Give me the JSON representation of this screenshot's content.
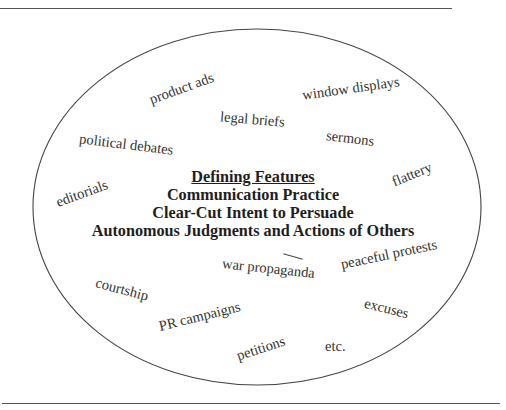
{
  "diagram": {
    "center": {
      "title": "Defining Features",
      "features": [
        "Communication Practice",
        "Clear-Cut Intent to Persuade",
        "Autonomous Judgments and Actions of Others"
      ]
    },
    "examples": [
      {
        "label": "product ads"
      },
      {
        "label": "window displays"
      },
      {
        "label": "legal briefs"
      },
      {
        "label": "sermons"
      },
      {
        "label": "political debates"
      },
      {
        "label": "flattery"
      },
      {
        "label": "editorials"
      },
      {
        "label": "peaceful protests"
      },
      {
        "label": "war propaganda"
      },
      {
        "label": "courtship"
      },
      {
        "label": "excuses"
      },
      {
        "label": "PR campaigns"
      },
      {
        "label": "petitions"
      },
      {
        "label": "etc."
      }
    ],
    "colors": {
      "line": "#444444",
      "text": "#2a2a2a",
      "background": "#ffffff"
    }
  }
}
